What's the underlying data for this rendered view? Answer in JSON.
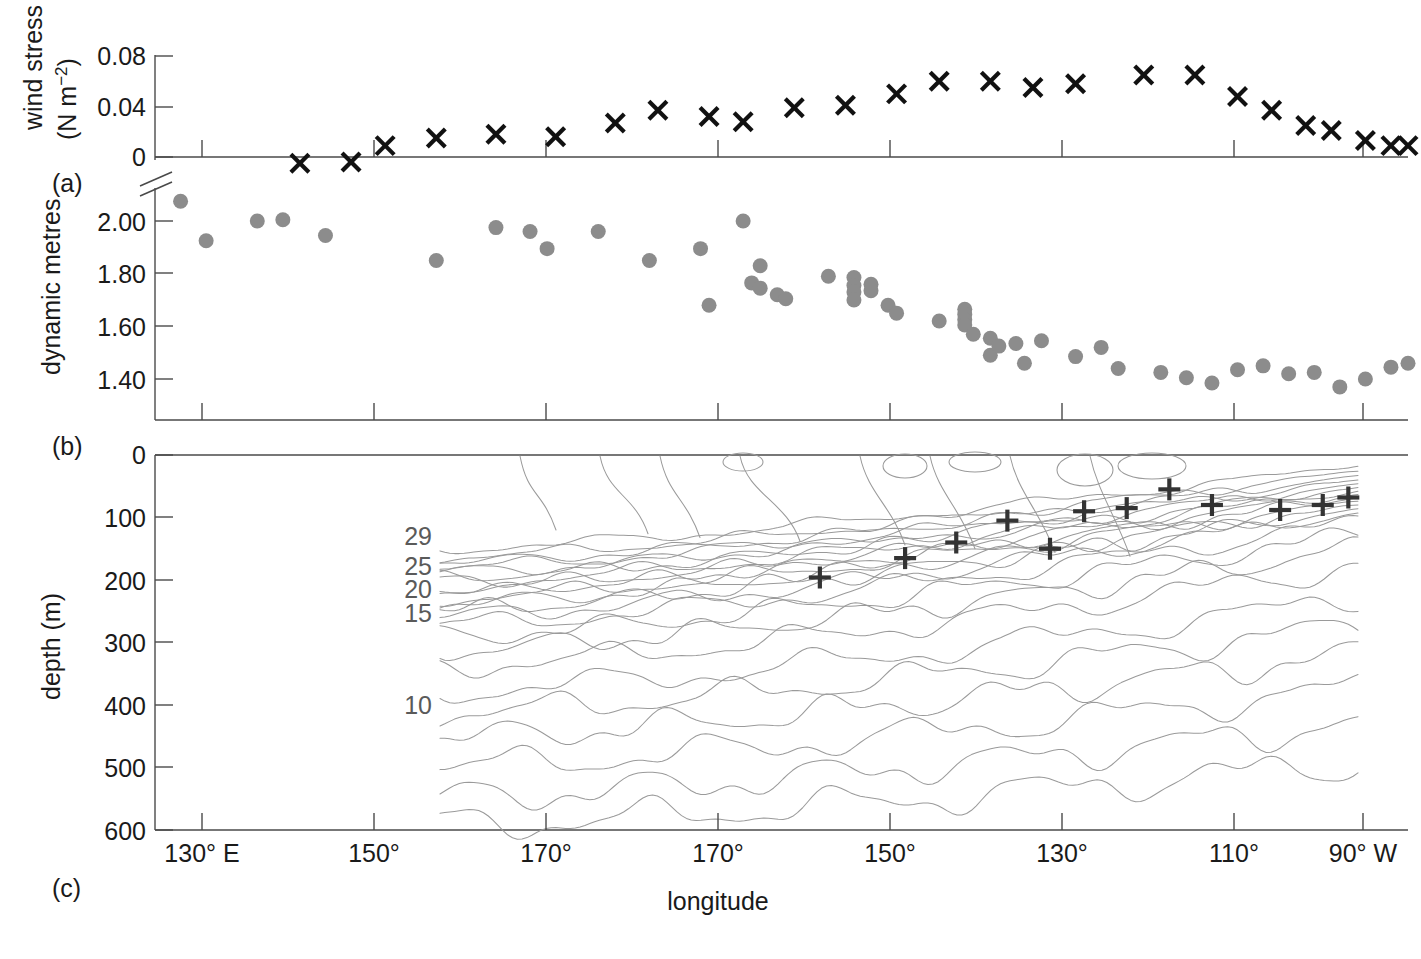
{
  "figure": {
    "xlabel": "longitude",
    "panel_labels": [
      "(a)",
      "(b)",
      "(c)"
    ],
    "x_tick_labels": [
      "130° E",
      "150°",
      "170°",
      "170°",
      "150°",
      "130°",
      "110°",
      "90° W"
    ],
    "x_tick_values": [
      130,
      150,
      170,
      -170,
      -150,
      -130,
      -110,
      -90
    ],
    "colors": {
      "marker_x": "#111111",
      "marker_dot": "#8c8c8c",
      "marker_plus": "#333333",
      "contour": "#9a9a9a",
      "axis": "#4a4a4a"
    }
  },
  "chart_data": [
    {
      "type": "scatter",
      "panel": "(a)",
      "title": "",
      "ylabel": "wind stress (N m⁻²)",
      "ylabel_line1": "wind stress",
      "ylabel_line2": "(N m",
      "ylabel_sup": "−2",
      "ylabel_line2_end": ")",
      "xlabel": "longitude",
      "y_tick_labels": [
        "0.08",
        "0.04",
        "0"
      ],
      "y_tick_values": [
        0.08,
        0.04,
        0
      ],
      "ylim": [
        0,
        0.08
      ],
      "xlim": [
        125,
        -88
      ],
      "grid": false,
      "marker": "x",
      "axis_break": true,
      "points": [
        {
          "x": 142,
          "y": -0.005
        },
        {
          "x": 148,
          "y": -0.004
        },
        {
          "x": 152,
          "y": 0.009
        },
        {
          "x": 158,
          "y": 0.015
        },
        {
          "x": 165,
          "y": 0.018
        },
        {
          "x": 172,
          "y": 0.016
        },
        {
          "x": 179,
          "y": 0.027
        },
        {
          "x": -176,
          "y": 0.037
        },
        {
          "x": -170,
          "y": 0.032
        },
        {
          "x": -166,
          "y": 0.028
        },
        {
          "x": -160,
          "y": 0.039
        },
        {
          "x": -154,
          "y": 0.041
        },
        {
          "x": -148,
          "y": 0.05
        },
        {
          "x": -143,
          "y": 0.06
        },
        {
          "x": -137,
          "y": 0.06
        },
        {
          "x": -132,
          "y": 0.055
        },
        {
          "x": -127,
          "y": 0.058
        },
        {
          "x": -119,
          "y": 0.065
        },
        {
          "x": -113,
          "y": 0.065
        },
        {
          "x": -108,
          "y": 0.048
        },
        {
          "x": -104,
          "y": 0.037
        },
        {
          "x": -100,
          "y": 0.025
        },
        {
          "x": -97,
          "y": 0.021
        },
        {
          "x": -93,
          "y": 0.013
        },
        {
          "x": -90,
          "y": 0.009
        },
        {
          "x": -88,
          "y": 0.009
        }
      ]
    },
    {
      "type": "scatter",
      "panel": "(b)",
      "title": "",
      "ylabel": "dynamic metres",
      "xlabel": "longitude",
      "y_tick_labels": [
        "2.00",
        "1.80",
        "1.60",
        "1.40"
      ],
      "y_tick_values": [
        2.0,
        1.8,
        1.6,
        1.4
      ],
      "ylim": [
        1.3,
        2.1
      ],
      "xlim": [
        125,
        -88
      ],
      "grid": false,
      "marker": "circle",
      "points": [
        {
          "x": 128,
          "y": 2.075
        },
        {
          "x": 131,
          "y": 1.925
        },
        {
          "x": 137,
          "y": 2.0
        },
        {
          "x": 140,
          "y": 2.005
        },
        {
          "x": 145,
          "y": 1.945
        },
        {
          "x": 158,
          "y": 1.85
        },
        {
          "x": 165,
          "y": 1.975
        },
        {
          "x": 169,
          "y": 1.96
        },
        {
          "x": 171,
          "y": 1.895
        },
        {
          "x": 177,
          "y": 1.96
        },
        {
          "x": -177,
          "y": 1.85
        },
        {
          "x": -171,
          "y": 1.895
        },
        {
          "x": -170,
          "y": 1.68
        },
        {
          "x": -166,
          "y": 2.0
        },
        {
          "x": -164,
          "y": 1.83
        },
        {
          "x": -165,
          "y": 1.765
        },
        {
          "x": -164,
          "y": 1.745
        },
        {
          "x": -162,
          "y": 1.72
        },
        {
          "x": -161,
          "y": 1.705
        },
        {
          "x": -156,
          "y": 1.79
        },
        {
          "x": -153,
          "y": 1.785
        },
        {
          "x": -153,
          "y": 1.755
        },
        {
          "x": -153,
          "y": 1.73
        },
        {
          "x": -153,
          "y": 1.7
        },
        {
          "x": -151,
          "y": 1.76
        },
        {
          "x": -151,
          "y": 1.735
        },
        {
          "x": -149,
          "y": 1.68
        },
        {
          "x": -148,
          "y": 1.65
        },
        {
          "x": -143,
          "y": 1.62
        },
        {
          "x": -140,
          "y": 1.665
        },
        {
          "x": -140,
          "y": 1.645
        },
        {
          "x": -140,
          "y": 1.625
        },
        {
          "x": -140,
          "y": 1.605
        },
        {
          "x": -139,
          "y": 1.57
        },
        {
          "x": -137,
          "y": 1.555
        },
        {
          "x": -137,
          "y": 1.49
        },
        {
          "x": -136,
          "y": 1.525
        },
        {
          "x": -134,
          "y": 1.535
        },
        {
          "x": -133,
          "y": 1.46
        },
        {
          "x": -131,
          "y": 1.545
        },
        {
          "x": -127,
          "y": 1.485
        },
        {
          "x": -124,
          "y": 1.52
        },
        {
          "x": -122,
          "y": 1.44
        },
        {
          "x": -117,
          "y": 1.425
        },
        {
          "x": -114,
          "y": 1.405
        },
        {
          "x": -111,
          "y": 1.385
        },
        {
          "x": -108,
          "y": 1.435
        },
        {
          "x": -105,
          "y": 1.45
        },
        {
          "x": -102,
          "y": 1.42
        },
        {
          "x": -99,
          "y": 1.425
        },
        {
          "x": -96,
          "y": 1.37
        },
        {
          "x": -93,
          "y": 1.4
        },
        {
          "x": -90,
          "y": 1.445
        },
        {
          "x": -88,
          "y": 1.46
        }
      ]
    },
    {
      "type": "contour",
      "panel": "(c)",
      "title": "",
      "ylabel": "depth (m)",
      "xlabel": "longitude",
      "y_tick_labels": [
        "0",
        "100",
        "200",
        "300",
        "400",
        "500",
        "600"
      ],
      "y_tick_values": [
        0,
        100,
        200,
        300,
        400,
        500,
        600
      ],
      "ylim": [
        0,
        600
      ],
      "xlim": [
        125,
        -88
      ],
      "grid": false,
      "contour_labels": [
        {
          "label": "29",
          "depth": 130
        },
        {
          "label": "25",
          "depth": 178
        },
        {
          "label": "20",
          "depth": 215
        },
        {
          "label": "15",
          "depth": 253
        },
        {
          "label": "10",
          "depth": 400
        }
      ],
      "marker": "plus",
      "thermocline_points": [
        {
          "x": -157,
          "depth": 196
        },
        {
          "x": -147,
          "depth": 165
        },
        {
          "x": -141,
          "depth": 140
        },
        {
          "x": -135,
          "depth": 105
        },
        {
          "x": -130,
          "depth": 150
        },
        {
          "x": -126,
          "depth": 90
        },
        {
          "x": -121,
          "depth": 85
        },
        {
          "x": -116,
          "depth": 55
        },
        {
          "x": -111,
          "depth": 80
        },
        {
          "x": -103,
          "depth": 88
        },
        {
          "x": -98,
          "depth": 80
        },
        {
          "x": -95,
          "depth": 68
        }
      ]
    }
  ]
}
